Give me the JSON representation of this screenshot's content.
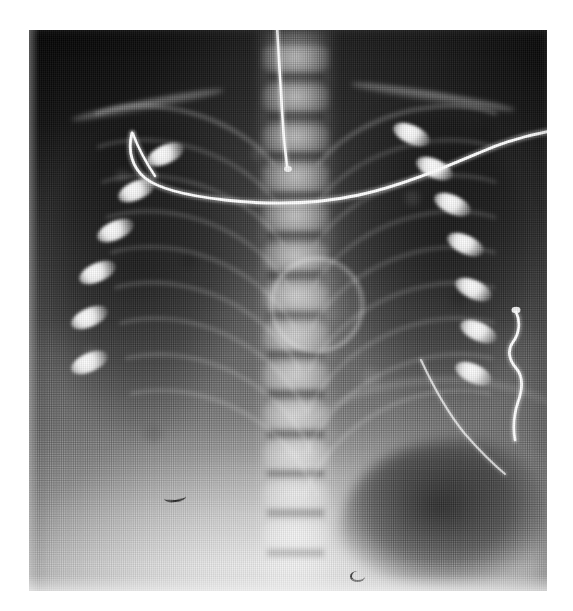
{
  "document": {
    "kind": "radiograph-figure",
    "modality": "X-ray",
    "view": "AP (anteroposterior) chest",
    "subject": "neonate / infant",
    "caption": "",
    "background_color": "#ffffff"
  },
  "plate": {
    "label": "chest-radiograph",
    "left": 29,
    "top": 30,
    "width": 518,
    "height": 561,
    "tone": {
      "darkest_hex": "#141414",
      "mid_hex": "#6a6a6a",
      "brightest_hex": "#dcdcdc",
      "gradient_note": "dark upper-left and upper-right corners, bright lower-centre"
    },
    "texture": {
      "print_screen": "halftone-dot",
      "dot_pitch_px": 2.4
    }
  },
  "anatomy": {
    "regions": [
      {
        "name": "lung-field-left",
        "side": "left",
        "appearance": "dark aerated"
      },
      {
        "name": "lung-field-right",
        "side": "right",
        "appearance": "dark aerated"
      },
      {
        "name": "mediastinum",
        "appearance": "bright central band"
      },
      {
        "name": "thoracic-spine",
        "appearance": "stacked vertebral bodies"
      },
      {
        "name": "abdomen",
        "appearance": "bright lower field"
      },
      {
        "name": "gastric-gas-bubble",
        "appearance": "dark lucency lower right"
      },
      {
        "name": "diaphragm",
        "appearance": "curved bright interface"
      }
    ],
    "vertebrae_count": 13,
    "ribs": {
      "left_visible": 9,
      "right_visible": 9,
      "posterior_rib_ends": "bright ovoid densities at costovertebral junctions"
    },
    "clavicles": 2,
    "ring_opacity": {
      "name": "central-ring-opacity",
      "center_fraction": [
        0.55,
        0.485
      ],
      "appearance": "circular bright ring, mid-mediastinum"
    }
  },
  "devices": [
    {
      "name": "endotracheal-tube",
      "description": "vertical radio-dense tube, upper midline",
      "brightness_hex": "#ffffff"
    },
    {
      "name": "ecg-lead-wire-upper",
      "description": "long curving wire crossing upper chest, exits right edge",
      "brightness_hex": "#ffffff"
    },
    {
      "name": "ecg-lead-wire-right",
      "description": "short looping wire at right lateral margin",
      "brightness_hex": "#ffffff"
    },
    {
      "name": "artefact-mark-lower-left",
      "description": "small dark linear artefact over left abdomen"
    },
    {
      "name": "artefact-mark-lower-centre",
      "description": "small dark hook artefact at lower border"
    }
  ]
}
